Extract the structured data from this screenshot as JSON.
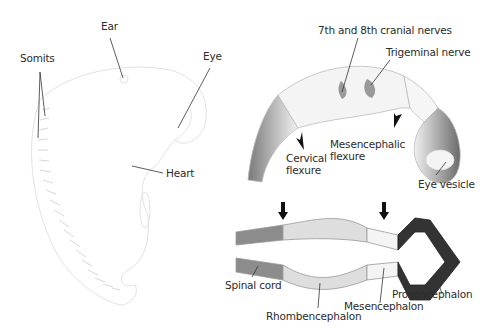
{
  "figure": {
    "panels": [
      {
        "name": "embryo-external-view",
        "labels": {
          "ear": "Ear",
          "eye": "Eye",
          "somits": "Somits",
          "heart": "Heart"
        }
      },
      {
        "name": "brain-lateral-view",
        "labels": {
          "cranial_nerves": "7th and 8th cranial nerves",
          "trigeminal": "Trigeminal nerve",
          "cervical_1": "Cervical",
          "cervical_2": "flexure",
          "mesencephalic_1": "Mesencephalic",
          "mesencephalic_2": "flexure",
          "eye_vesicle": "Eye vesicle"
        }
      },
      {
        "name": "neural-tube-section",
        "labels": {
          "spinal_cord": "Spinal cord",
          "rhombencephalon": "Rhombencephalon",
          "mesencephalon": "Mesencephalon",
          "prosencephalon": "Prosencephalon"
        }
      }
    ],
    "colors": {
      "spinal_cord": "#8c8c8c",
      "rhombencephalon": "#dedede",
      "mesencephalon": "#f4f4f4",
      "prosencephalon": "#333333",
      "outline": "#cfcfcf",
      "leader_line": "#333333"
    }
  }
}
